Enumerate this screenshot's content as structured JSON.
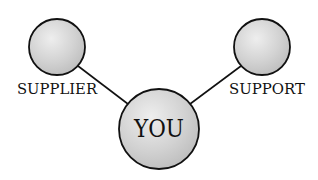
{
  "diagram": {
    "nodes": [
      {
        "id": "supplier",
        "label": "SUPPLIER",
        "cx": 57,
        "cy": 47,
        "r": 28
      },
      {
        "id": "support",
        "label": "SUPPORT",
        "cx": 262,
        "cy": 47,
        "r": 28
      },
      {
        "id": "you",
        "label": "YOU",
        "cx": 159,
        "cy": 129,
        "r": 40
      }
    ],
    "edges": [
      {
        "from": "supplier",
        "to": "you"
      },
      {
        "from": "support",
        "to": "you"
      }
    ],
    "colors": {
      "stroke": "#111111",
      "fill_light": "#ececec",
      "fill_dark": "#b8b8b8"
    }
  }
}
